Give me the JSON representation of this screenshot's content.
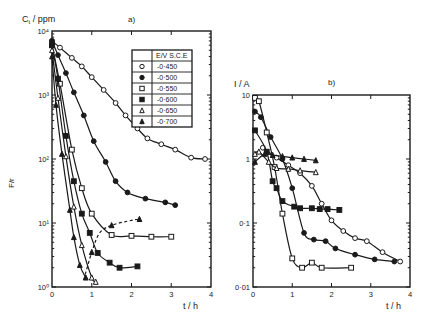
{
  "figure": {
    "panel_a": {
      "label": "a)",
      "ylabel": "C_t / ppm",
      "ylabel_main": "C",
      "ylabel_sub": "t",
      "ylabel_unit": " / ppm",
      "side_label": "F/r",
      "xlabel": "t / h",
      "ytick_labels": [
        "10⁰",
        "10¹",
        "10²",
        "10³",
        "10⁴"
      ],
      "xtick_labels": [
        "0",
        "1",
        "2",
        "3",
        "4"
      ]
    },
    "panel_b": {
      "label": "b)",
      "ylabel": "I / A",
      "xlabel": "t / h",
      "ytick_labels": [
        "0·01",
        "0·1",
        "1",
        "10"
      ],
      "xtick_labels": [
        "0",
        "1",
        "2",
        "3",
        "4"
      ]
    },
    "legend": {
      "header": "E/V S.C.E",
      "entries": [
        {
          "marker": "open-circle",
          "label": "-0·450"
        },
        {
          "marker": "filled-circle",
          "label": "-0·500"
        },
        {
          "marker": "open-square",
          "label": "-0·550"
        },
        {
          "marker": "filled-square",
          "label": "-0·600"
        },
        {
          "marker": "open-triangle",
          "label": "-0·650"
        },
        {
          "marker": "filled-triangle",
          "label": "-0·700"
        }
      ]
    }
  },
  "chart_data": [
    {
      "type": "line",
      "title": "a)",
      "xlabel": "t / h",
      "ylabel": "C_t / ppm",
      "yscale": "log",
      "xlim": [
        0,
        4
      ],
      "ylim": [
        1,
        10000
      ],
      "legend_title": "E/V S.C.E",
      "legend_position": "upper right",
      "series": [
        {
          "name": "-0.450",
          "marker": "open-circle",
          "x": [
            0,
            0.2,
            0.5,
            0.75,
            1.0,
            1.3,
            1.6,
            1.85,
            2.15,
            2.4,
            2.75,
            3.1,
            3.5,
            3.85
          ],
          "y": [
            7000,
            5500,
            3800,
            2800,
            1900,
            1200,
            750,
            480,
            300,
            210,
            170,
            140,
            105,
            100
          ]
        },
        {
          "name": "-0.500",
          "marker": "filled-circle",
          "x": [
            0,
            0.15,
            0.35,
            0.55,
            0.8,
            1.05,
            1.35,
            1.6,
            1.9,
            2.35,
            2.85,
            3.1
          ],
          "y": [
            7000,
            4200,
            2200,
            1100,
            480,
            190,
            90,
            45,
            30,
            24,
            21,
            19
          ]
        },
        {
          "name": "-0.550",
          "marker": "open-square",
          "x": [
            0,
            0.2,
            0.5,
            0.75,
            1.0,
            1.5,
            2.0,
            2.5,
            3.0
          ],
          "y": [
            6000,
            1500,
            140,
            35,
            14,
            6.5,
            6.3,
            6.1,
            6.1
          ]
        },
        {
          "name": "-0.600",
          "marker": "filled-square",
          "x": [
            0,
            0.15,
            0.35,
            0.55,
            0.75,
            0.95,
            1.15,
            1.45,
            1.7,
            2.15
          ],
          "y": [
            6000,
            1800,
            230,
            45,
            14,
            7,
            3.4,
            2.4,
            2.0,
            2.1
          ]
        },
        {
          "name": "-0.650",
          "marker": "open-triangle",
          "x": [
            0,
            0.15,
            0.35,
            0.55,
            0.75,
            1.0,
            1.1
          ],
          "y": [
            5000,
            900,
            110,
            18,
            4.5,
            1.4,
            1.2
          ]
        },
        {
          "name": "-0.700",
          "marker": "filled-triangle",
          "x": [
            0,
            0.1,
            0.25,
            0.45,
            0.55,
            0.7,
            0.85
          ],
          "y": [
            4000,
            700,
            120,
            16,
            6,
            2.2,
            1.4
          ]
        },
        {
          "name": "dashed (-0.650 regrowth)",
          "marker": "filled-triangle",
          "style": "dashed",
          "x": [
            0.8,
            1.0,
            1.2,
            1.5,
            2.0,
            2.2
          ],
          "y": [
            1.3,
            3.5,
            7,
            9.2,
            11,
            11.5
          ]
        }
      ]
    },
    {
      "type": "line",
      "title": "b)",
      "xlabel": "t / h",
      "ylabel": "I / A",
      "yscale": "log",
      "xlim": [
        0,
        4
      ],
      "ylim": [
        0.01,
        10
      ],
      "series": [
        {
          "name": "-0.450",
          "marker": "open-circle",
          "x": [
            0.25,
            0.6,
            0.9,
            1.2,
            1.5,
            1.75,
            2.0,
            2.3,
            2.6,
            2.9,
            3.3,
            3.75
          ],
          "y": [
            1.5,
            1.05,
            0.8,
            0.6,
            0.38,
            0.2,
            0.11,
            0.075,
            0.058,
            0.052,
            0.035,
            0.025
          ]
        },
        {
          "name": "-0.500",
          "marker": "filled-circle",
          "x": [
            0.05,
            0.2,
            0.45,
            0.75,
            1.0,
            1.3,
            1.55,
            1.85,
            2.1,
            2.6,
            3.1,
            3.6
          ],
          "y": [
            5.5,
            4.5,
            2.2,
            1.0,
            0.35,
            0.07,
            0.055,
            0.052,
            0.04,
            0.032,
            0.027,
            0.025
          ]
        },
        {
          "name": "-0.550",
          "marker": "open-square",
          "x": [
            0.05,
            0.15,
            0.35,
            0.55,
            0.75,
            1.0,
            1.25,
            1.5,
            1.75,
            2.5
          ],
          "y": [
            9,
            8,
            2.6,
            0.75,
            0.14,
            0.028,
            0.02,
            0.024,
            0.02,
            0.02
          ]
        },
        {
          "name": "-0.600",
          "marker": "filled-square",
          "x": [
            0.05,
            0.35,
            0.5,
            0.6,
            0.75,
            1.05,
            1.2,
            1.5,
            1.7,
            1.9,
            2.2
          ],
          "y": [
            2.8,
            1.3,
            0.45,
            0.35,
            0.22,
            0.18,
            0.17,
            0.17,
            0.165,
            0.165,
            0.16
          ]
        },
        {
          "name": "-0.650",
          "marker": "open-triangle",
          "x": [
            0.05,
            0.15,
            0.4,
            0.6,
            0.9,
            1.2,
            1.6
          ],
          "y": [
            1.2,
            1.3,
            0.9,
            0.72,
            0.7,
            0.66,
            0.62
          ]
        },
        {
          "name": "-0.700",
          "marker": "filled-triangle",
          "x": [
            0.05,
            0.3,
            0.5,
            0.75,
            1.0,
            1.3,
            1.6
          ],
          "y": [
            0.9,
            1.2,
            1.15,
            1.1,
            1.05,
            1.0,
            0.95
          ]
        }
      ]
    }
  ]
}
